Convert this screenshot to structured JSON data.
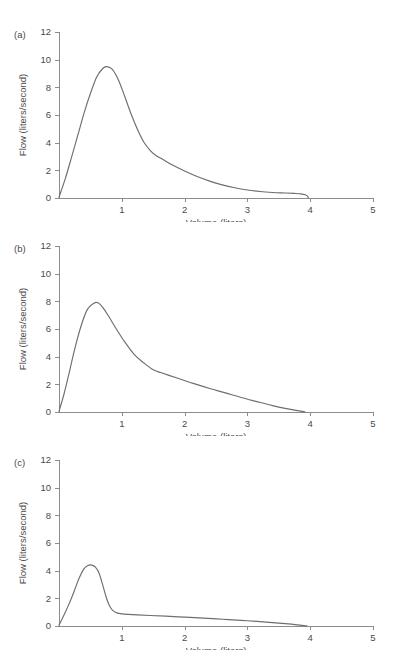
{
  "figure": {
    "background_color": "#ffffff",
    "line_color": "#6e6e6e",
    "axis_color": "#8c8c8c",
    "text_color": "#4a4a4a"
  },
  "panels": [
    {
      "label": "(a)",
      "xlabel": "Volume (liters)",
      "ylabel": "Flow (liters/second)",
      "xticks": [
        "1",
        "2",
        "3",
        "4",
        "5"
      ],
      "yticks": [
        "0",
        "2",
        "4",
        "6",
        "8",
        "10",
        "12"
      ]
    },
    {
      "label": "(b)",
      "xlabel": "Volume (liters)",
      "ylabel": "Flow (liters/second)",
      "xticks": [
        "1",
        "2",
        "3",
        "4",
        "5"
      ],
      "yticks": [
        "0",
        "2",
        "4",
        "6",
        "8",
        "10",
        "12"
      ]
    },
    {
      "label": "(c)",
      "xlabel": "Volume (liters)",
      "ylabel": "Flow (liters/second)",
      "xticks": [
        "1",
        "2",
        "3",
        "4",
        "5"
      ],
      "yticks": [
        "0",
        "2",
        "4",
        "6",
        "8",
        "10",
        "12"
      ]
    }
  ],
  "chart_data": [
    {
      "type": "line",
      "title": "(a)",
      "xlabel": "Volume (liters)",
      "ylabel": "Flow (liters/second)",
      "xlim": [
        0,
        5
      ],
      "ylim": [
        0,
        12
      ],
      "xticks": [
        1,
        2,
        3,
        4,
        5
      ],
      "yticks": [
        0,
        2,
        4,
        6,
        8,
        10,
        12
      ],
      "grid": false,
      "legend": "none",
      "series": [
        {
          "name": "Normal flow-volume loop",
          "x": [
            0.0,
            0.1,
            0.2,
            0.3,
            0.4,
            0.5,
            0.6,
            0.7,
            0.76,
            0.85,
            0.95,
            1.05,
            1.15,
            1.25,
            1.35,
            1.45,
            1.55,
            1.65,
            1.8,
            2.0,
            2.2,
            2.4,
            2.6,
            2.8,
            3.0,
            3.2,
            3.4,
            3.6,
            3.75,
            3.85,
            3.92,
            3.96,
            3.97
          ],
          "y": [
            0.05,
            1.4,
            2.95,
            4.55,
            6.15,
            7.55,
            8.75,
            9.38,
            9.5,
            9.3,
            8.5,
            7.3,
            6.05,
            4.95,
            4.05,
            3.45,
            3.05,
            2.8,
            2.4,
            1.95,
            1.55,
            1.22,
            0.95,
            0.74,
            0.58,
            0.47,
            0.4,
            0.36,
            0.33,
            0.3,
            0.24,
            0.12,
            0.0
          ]
        }
      ]
    },
    {
      "type": "line",
      "title": "(b)",
      "xlabel": "Volume (liters)",
      "ylabel": "Flow (liters/second)",
      "xlim": [
        0,
        5
      ],
      "ylim": [
        0,
        12
      ],
      "xticks": [
        1,
        2,
        3,
        4,
        5
      ],
      "yticks": [
        0,
        2,
        4,
        6,
        8,
        10,
        12
      ],
      "grid": false,
      "legend": "none",
      "series": [
        {
          "name": "Mild obstruction flow-volume loop",
          "x": [
            0.0,
            0.08,
            0.16,
            0.25,
            0.35,
            0.45,
            0.55,
            0.62,
            0.7,
            0.8,
            0.92,
            1.05,
            1.2,
            1.35,
            1.5,
            1.62,
            1.75,
            1.95,
            2.15,
            2.4,
            2.65,
            2.9,
            3.15,
            3.4,
            3.6,
            3.75,
            3.85,
            3.92
          ],
          "y": [
            0.05,
            1.3,
            2.8,
            4.55,
            6.2,
            7.4,
            7.85,
            7.9,
            7.55,
            6.85,
            5.95,
            5.05,
            4.15,
            3.55,
            3.05,
            2.85,
            2.65,
            2.35,
            2.05,
            1.7,
            1.38,
            1.05,
            0.75,
            0.46,
            0.26,
            0.14,
            0.06,
            0.0
          ]
        }
      ]
    },
    {
      "type": "line",
      "title": "(c)",
      "xlabel": "Volume (liters)",
      "ylabel": "Flow (liters/second)",
      "xlim": [
        0,
        5
      ],
      "ylim": [
        0,
        12
      ],
      "xticks": [
        1,
        2,
        3,
        4,
        5
      ],
      "yticks": [
        0,
        2,
        4,
        6,
        8,
        10,
        12
      ],
      "grid": false,
      "legend": "none",
      "series": [
        {
          "name": "Severe obstruction flow-volume loop",
          "x": [
            0.0,
            0.08,
            0.16,
            0.24,
            0.32,
            0.4,
            0.46,
            0.52,
            0.58,
            0.64,
            0.7,
            0.75,
            0.8,
            0.85,
            0.92,
            1.0,
            1.1,
            1.25,
            1.45,
            1.7,
            2.0,
            2.3,
            2.6,
            2.9,
            3.2,
            3.45,
            3.65,
            3.8,
            3.9,
            3.95
          ],
          "y": [
            0.05,
            0.8,
            1.6,
            2.5,
            3.45,
            4.15,
            4.38,
            4.4,
            4.25,
            3.8,
            2.9,
            2.1,
            1.5,
            1.15,
            0.95,
            0.88,
            0.84,
            0.8,
            0.76,
            0.71,
            0.64,
            0.57,
            0.49,
            0.41,
            0.32,
            0.23,
            0.15,
            0.08,
            0.03,
            0.0
          ]
        }
      ]
    }
  ]
}
